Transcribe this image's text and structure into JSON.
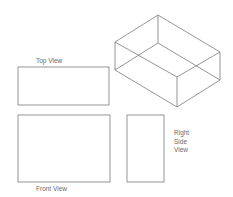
{
  "diagram": {
    "colors": {
      "line": "#7a7a7a",
      "text": "#6a6a6a",
      "background": "#ffffff"
    },
    "isometric_box": {
      "vertices": {
        "top_back": [
          158,
          15
        ],
        "top_left": [
          115,
          42
        ],
        "top_right": [
          220,
          52
        ],
        "top_front": [
          177,
          77
        ],
        "bottom_back": [
          158,
          43
        ],
        "bottom_left": [
          115,
          70
        ],
        "bottom_right": [
          220,
          80
        ],
        "bottom_front": [
          177,
          107
        ]
      }
    },
    "views": [
      {
        "id": "top",
        "label": "Top View",
        "rect": {
          "x": 18,
          "y": 67,
          "w": 91,
          "h": 38
        }
      },
      {
        "id": "front",
        "label": "Front View",
        "rect": {
          "x": 18,
          "y": 115,
          "w": 92,
          "h": 67
        }
      },
      {
        "id": "right-side",
        "label_lines": [
          "Right",
          "Side",
          "View"
        ],
        "rect": {
          "x": 127,
          "y": 115,
          "w": 37,
          "h": 67
        }
      }
    ]
  }
}
